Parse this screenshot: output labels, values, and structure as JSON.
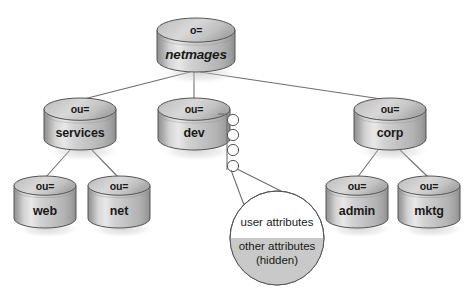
{
  "diagram": {
    "style": {
      "cylinder_light": "#efefef",
      "cylinder_mid": "#c9c9c9",
      "cylinder_dark": "#9a9a9a",
      "cylinder_edge_dark": "#7d7d7d",
      "outline": "#555555",
      "line": "#6e6e6e",
      "circle_fill": "#ffffff",
      "attr_gray": "#c9c9c9",
      "background": "#ffffff",
      "text": "#1a1a1a"
    },
    "nodes": [
      {
        "id": "root",
        "prefix": "o=",
        "name": "netmages",
        "italic": true,
        "x": 157,
        "y": 18,
        "w": 78,
        "h": 54,
        "level": 0
      },
      {
        "id": "services",
        "prefix": "ou=",
        "name": "services",
        "italic": false,
        "x": 44,
        "y": 98,
        "w": 72,
        "h": 52,
        "level": 1
      },
      {
        "id": "dev",
        "prefix": "ou=",
        "name": "dev",
        "italic": false,
        "x": 158,
        "y": 98,
        "w": 72,
        "h": 52,
        "level": 1
      },
      {
        "id": "corp",
        "prefix": "ou=",
        "name": "corp",
        "italic": false,
        "x": 354,
        "y": 98,
        "w": 72,
        "h": 52,
        "level": 1
      },
      {
        "id": "web",
        "prefix": "ou=",
        "name": "web",
        "italic": false,
        "x": 14,
        "y": 176,
        "w": 62,
        "h": 52,
        "level": 2
      },
      {
        "id": "net",
        "prefix": "ou=",
        "name": "net",
        "italic": false,
        "x": 88,
        "y": 176,
        "w": 62,
        "h": 52,
        "level": 2
      },
      {
        "id": "admin",
        "prefix": "ou=",
        "name": "admin",
        "italic": false,
        "x": 326,
        "y": 176,
        "w": 62,
        "h": 52,
        "level": 2
      },
      {
        "id": "mktg",
        "prefix": "ou=",
        "name": "mktg",
        "italic": false,
        "x": 398,
        "y": 176,
        "w": 62,
        "h": 52,
        "level": 2
      }
    ],
    "edges": [
      {
        "id": "root-services",
        "from": "root",
        "to": "services",
        "x1": 190,
        "y1": 72,
        "x2": 80,
        "y2": 100
      },
      {
        "id": "root-dev",
        "from": "root",
        "to": "dev",
        "x1": 194,
        "y1": 72,
        "x2": 194,
        "y2": 100
      },
      {
        "id": "root-corp",
        "from": "root",
        "to": "corp",
        "x1": 200,
        "y1": 72,
        "x2": 388,
        "y2": 100
      },
      {
        "id": "services-web",
        "from": "services",
        "to": "web",
        "x1": 70,
        "y1": 150,
        "x2": 45,
        "y2": 178
      },
      {
        "id": "services-net",
        "from": "services",
        "to": "net",
        "x1": 92,
        "y1": 150,
        "x2": 119,
        "y2": 178
      },
      {
        "id": "corp-admin",
        "from": "corp",
        "to": "admin",
        "x1": 378,
        "y1": 150,
        "x2": 357,
        "y2": 178
      },
      {
        "id": "corp-mktg",
        "from": "corp",
        "to": "mktg",
        "x1": 400,
        "y1": 150,
        "x2": 429,
        "y2": 178
      }
    ],
    "entry_chain": {
      "id": "dev-entries",
      "label": "entry nodes attached to dev",
      "stem_x": 227,
      "stem_y_top": 114,
      "stem_y_bottom": 170,
      "branch_x": 218,
      "branch_y": 114,
      "circle_radius": 5.6,
      "circles": [
        {
          "cx": 233,
          "cy": 120
        },
        {
          "cx": 233,
          "cy": 135
        },
        {
          "cx": 233,
          "cy": 150
        },
        {
          "cx": 233,
          "cy": 166
        }
      ]
    },
    "attribute_bubble": {
      "id": "attributes-circle",
      "cx": 277,
      "cy": 238,
      "r": 47,
      "split_y": 238,
      "lines": [
        {
          "id": "visible-attrs",
          "text": "user attributes",
          "italic": false,
          "shaded": false
        },
        {
          "id": "hidden-attrs-1",
          "text": "other attributes",
          "italic": false,
          "shaded": true
        },
        {
          "id": "hidden-attrs-2",
          "text": "(hidden)",
          "italic": true,
          "shaded": true
        }
      ],
      "connectors": [
        {
          "id": "bubble-connector-left",
          "x1": 231,
          "y1": 170,
          "x2": 244,
          "y2": 205
        },
        {
          "id": "bubble-connector-right",
          "x1": 237,
          "y1": 169,
          "x2": 283,
          "y2": 192
        }
      ]
    }
  }
}
